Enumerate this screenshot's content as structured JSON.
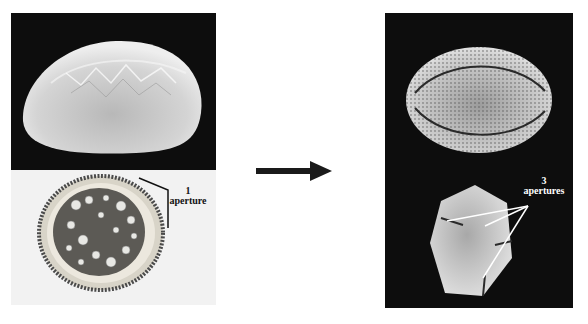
{
  "left": {
    "top_image": "monosulcate-pollen-sem",
    "bottom_image": "monosulcate-pollen-cross-section",
    "label_count": "1",
    "label_word": "aperture"
  },
  "arrow": {
    "direction": "right",
    "color": "#1a1a1a"
  },
  "right": {
    "top_image": "tricolpate-pollen-sem-side",
    "bottom_image": "tricolpate-pollen-sem-polar",
    "label_count": "3",
    "label_word": "apertures"
  },
  "colors": {
    "sem_bg": "#0d0d0d",
    "section_bg": "#f2f2f2",
    "label_dark": "#111111",
    "label_light": "#ffffff"
  }
}
